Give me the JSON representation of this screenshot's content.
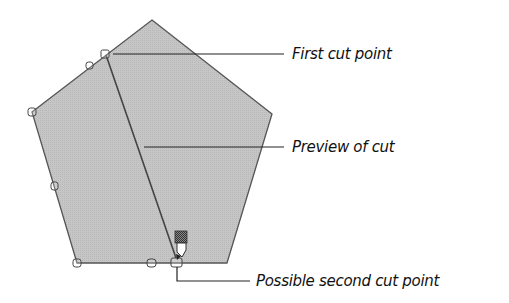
{
  "diagram": {
    "shape": "pentagon",
    "fill_color": "#c4c4c4",
    "stroke_color": "#555555",
    "labels": {
      "first_cut": "First cut point",
      "preview": "Preview of cut",
      "second_cut": "Possible second cut point"
    }
  }
}
